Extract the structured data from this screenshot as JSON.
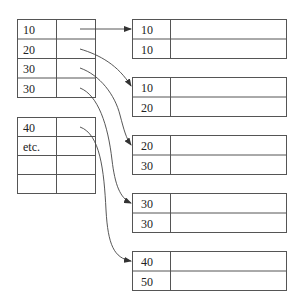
{
  "diagram": {
    "index_blocks": [
      {
        "rows": [
          {
            "key": "10",
            "pointer": true
          },
          {
            "key": "20",
            "pointer": true
          },
          {
            "key": "30",
            "pointer": true
          },
          {
            "key": "30",
            "pointer": true
          }
        ]
      },
      {
        "rows": [
          {
            "key": "40",
            "pointer": true
          },
          {
            "key": "etc.",
            "pointer": false
          },
          {
            "key": "",
            "pointer": false
          },
          {
            "key": "",
            "pointer": false
          }
        ]
      }
    ],
    "data_blocks": [
      {
        "rows": [
          "10",
          "10"
        ]
      },
      {
        "rows": [
          "10",
          "20"
        ]
      },
      {
        "rows": [
          "20",
          "30"
        ]
      },
      {
        "rows": [
          "30",
          "30"
        ]
      },
      {
        "rows": [
          "40",
          "50"
        ]
      }
    ],
    "colors": {
      "line": "#555555",
      "text": "#222222"
    }
  }
}
